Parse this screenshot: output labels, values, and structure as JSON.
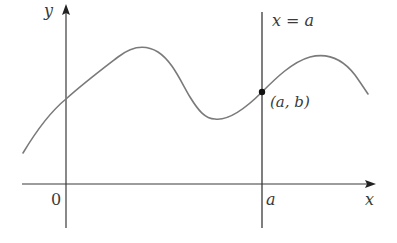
{
  "diagram": {
    "colors": {
      "axes": "#3a3a3a",
      "curve": "#7a7a7a",
      "vertical_line": "#3a3a3a",
      "point": "#111111",
      "background": "#ffffff"
    },
    "axes": {
      "x_label": "x",
      "y_label": "y",
      "origin_label": "0",
      "x_tick_label": "a"
    },
    "vertical_line": {
      "label": "x = a"
    },
    "point": {
      "label": "(a, b)"
    }
  }
}
